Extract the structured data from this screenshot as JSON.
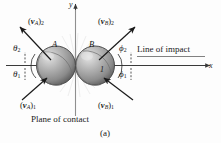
{
  "figure": {
    "caption": "(a)",
    "plane_label": "Plane of contact",
    "line_label": "Line of impact",
    "axes": {
      "x": "x",
      "y": "y"
    },
    "bodies": [
      {
        "name": "A",
        "label": "A"
      },
      {
        "name": "B",
        "label": "B"
      }
    ],
    "marks": {
      "one": "1"
    },
    "colors": {
      "background": "#fdfdfd",
      "ink": "#1a1a1a",
      "axis": "#3a3a3a",
      "sphere_light": "#d9d9d9",
      "sphere_mid": "#9a9a9a",
      "sphere_dark": "#5e5e5e",
      "sphere_edge": "#3f3f3f"
    },
    "vectors": [
      {
        "id": "vA2",
        "open": "(",
        "bold": "v",
        "sub": "A",
        "close": ")",
        "index": "2",
        "direction": "up-left",
        "quadrant": "top-left"
      },
      {
        "id": "vB2",
        "open": "(",
        "bold": "v",
        "sub": "B",
        "close": ")",
        "index": "2",
        "direction": "up-right",
        "quadrant": "top-right"
      },
      {
        "id": "vA1",
        "open": "(",
        "bold": "v",
        "sub": "A",
        "close": ")",
        "index": "1",
        "direction": "up-right",
        "quadrant": "bottom-left"
      },
      {
        "id": "vB1",
        "open": "(",
        "bold": "v",
        "sub": "B",
        "close": ")",
        "index": "1",
        "direction": "up-left",
        "quadrant": "bottom-right"
      }
    ],
    "angles": [
      {
        "id": "theta2",
        "glyph": "θ",
        "index": "2",
        "side": "left",
        "position": "above-axis"
      },
      {
        "id": "theta1",
        "glyph": "θ",
        "index": "1",
        "side": "left",
        "position": "below-axis"
      },
      {
        "id": "phi2",
        "glyph": "ϕ",
        "index": "2",
        "side": "right",
        "position": "above-axis"
      },
      {
        "id": "phi1",
        "glyph": "ϕ",
        "index": "1",
        "side": "right",
        "position": "below-axis"
      }
    ]
  }
}
